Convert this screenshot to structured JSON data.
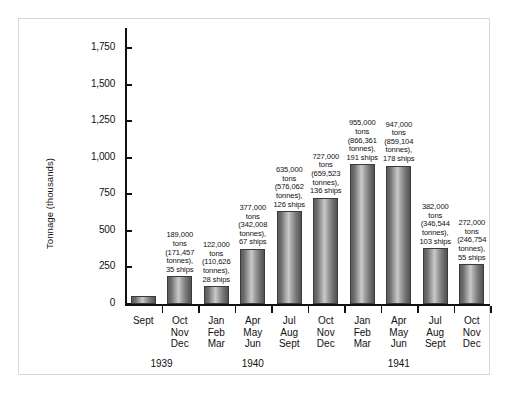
{
  "chart_data": {
    "type": "bar",
    "title": "",
    "xlabel": "",
    "ylabel": "Tonnage (thousands)",
    "ylim": [
      0,
      1875
    ],
    "yticks": [
      0,
      250,
      500,
      750,
      1000,
      1250,
      1500,
      1750
    ],
    "ytick_labels": [
      "0",
      "250",
      "500",
      "750",
      "1,000",
      "1,250",
      "1,500",
      "1,750"
    ],
    "grid": false,
    "legend": "none",
    "categories": [
      "Sept",
      "Oct Nov Dec",
      "Jan Feb Mar",
      "Apr May Jun",
      "Jul Aug Sept",
      "Oct Nov Dec",
      "Jan Feb Mar",
      "Apr May Jun",
      "Jul Aug Sept",
      "Oct Nov Dec"
    ],
    "values": [
      53,
      189,
      122,
      377,
      635,
      727,
      955,
      947,
      382,
      272
    ],
    "year_groups": [
      {
        "year": "1939",
        "label": "1939"
      },
      {
        "year": "1940",
        "label": "1940"
      },
      {
        "year": "1941",
        "label": "1941"
      }
    ]
  },
  "yaxis": {
    "title": "Tonnage (thousands)",
    "ticks": [
      {
        "value": 1750,
        "label": "1,750"
      },
      {
        "value": 1500,
        "label": "1,500"
      },
      {
        "value": 1250,
        "label": "1,250"
      },
      {
        "value": 1000,
        "label": "1,000"
      },
      {
        "value": 750,
        "label": "750"
      },
      {
        "value": 500,
        "label": "500"
      },
      {
        "value": 250,
        "label": "250"
      },
      {
        "value": 0,
        "label": "0"
      }
    ]
  },
  "bars": [
    {
      "id": "bar-1939-sept",
      "months": [
        "Sept"
      ],
      "value": 53,
      "label_lines": []
    },
    {
      "id": "bar-1939-q4",
      "months": [
        "Oct",
        "Nov",
        "Dec"
      ],
      "value": 189,
      "label_lines": [
        "189,000",
        "tons",
        "(171,457",
        "tonnes),",
        "35 ships"
      ]
    },
    {
      "id": "bar-1940-q1",
      "months": [
        "Jan",
        "Feb",
        "Mar"
      ],
      "value": 122,
      "label_lines": [
        "122,000",
        "tons",
        "(110,626",
        "tonnes),",
        "28 ships"
      ]
    },
    {
      "id": "bar-1940-q2",
      "months": [
        "Apr",
        "May",
        "Jun"
      ],
      "value": 377,
      "label_lines": [
        "377,000",
        "tons",
        "(342,008",
        "tonnes),",
        "67 ships"
      ]
    },
    {
      "id": "bar-1940-q3",
      "months": [
        "Jul",
        "Aug",
        "Sept"
      ],
      "value": 635,
      "label_lines": [
        "635,000",
        "tons",
        "(576,062",
        "tonnes),",
        "126 ships"
      ]
    },
    {
      "id": "bar-1940-q4",
      "months": [
        "Oct",
        "Nov",
        "Dec"
      ],
      "value": 727,
      "label_lines": [
        "727,000",
        "tons",
        "(659,523",
        "tonnes),",
        "136 ships"
      ]
    },
    {
      "id": "bar-1941-q1",
      "months": [
        "Jan",
        "Feb",
        "Mar"
      ],
      "value": 955,
      "label_lines": [
        "955,000",
        "tons",
        "(866,361",
        "tonnes),",
        "191 ships"
      ]
    },
    {
      "id": "bar-1941-q2",
      "months": [
        "Apr",
        "May",
        "Jun"
      ],
      "value": 947,
      "label_lines": [
        "947,000",
        "tons",
        "(859,104",
        "tonnes),",
        "178 ships"
      ]
    },
    {
      "id": "bar-1941-q3",
      "months": [
        "Jul",
        "Aug",
        "Sept"
      ],
      "value": 382,
      "label_lines": [
        "382,000",
        "tons",
        "(346,544",
        "tonnes),",
        "103 ships"
      ]
    },
    {
      "id": "bar-1941-q4",
      "months": [
        "Oct",
        "Nov",
        "Dec"
      ],
      "value": 272,
      "label_lines": [
        "272,000",
        "tons",
        "(246,754",
        "tonnes),",
        "55 ships"
      ]
    }
  ],
  "category_labels": [
    {
      "lines": [
        "Sept"
      ]
    },
    {
      "lines": [
        "Oct",
        "Nov",
        "Dec"
      ]
    },
    {
      "lines": [
        "Jan",
        "Feb",
        "Mar"
      ]
    },
    {
      "lines": [
        "Apr",
        "May",
        "Jun"
      ]
    },
    {
      "lines": [
        "Jul",
        "Aug",
        "Sept"
      ]
    },
    {
      "lines": [
        "Oct",
        "Nov",
        "Dec"
      ]
    },
    {
      "lines": [
        "Jan",
        "Feb",
        "Mar"
      ]
    },
    {
      "lines": [
        "Apr",
        "May",
        "Jun"
      ]
    },
    {
      "lines": [
        "Jul",
        "Aug",
        "Sept"
      ]
    },
    {
      "lines": [
        "Oct",
        "Nov",
        "Dec"
      ]
    }
  ],
  "years": [
    {
      "label": "1939",
      "center_index": 0.5
    },
    {
      "label": "1940",
      "center_index": 3
    },
    {
      "label": "1941",
      "center_index": 7
    }
  ],
  "colors": {
    "bar_dark": "#525252",
    "bar_light": "#c9c9c9",
    "axis": "#111111",
    "frame": "#d8d8d8",
    "background": "#ffffff"
  }
}
